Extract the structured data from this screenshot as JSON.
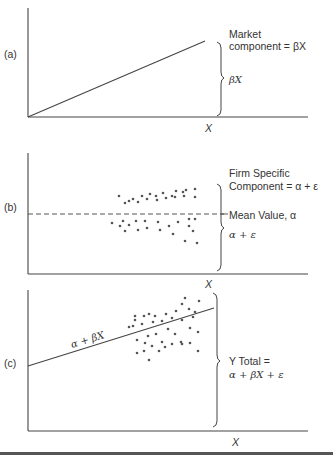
{
  "figure": {
    "panels": [
      {
        "id": "a",
        "tag": "(a)",
        "x_axis_label": "X",
        "labels": {
          "title_line1": "Market",
          "title_line2": "component = βX",
          "brace_label": "βX"
        },
        "line": {
          "label": "",
          "x1": 28,
          "y1": 117,
          "x2": 205,
          "y2": 41
        }
      },
      {
        "id": "b",
        "tag": "(b)",
        "x_axis_label": "X",
        "labels": {
          "title_line1": "Firm Specific",
          "title_line2": "Component = α + ε",
          "mean_label": "Mean Value, α",
          "brace_label": "α + ε"
        },
        "mean_line_y": 214
      },
      {
        "id": "c",
        "tag": "(c)",
        "x_axis_label": "X",
        "labels": {
          "line_label": "α + βX",
          "total_line1": "Y Total =",
          "total_line2": "α + βX + ε"
        },
        "line": {
          "x1": 28,
          "y1": 366,
          "x2": 214,
          "y2": 308
        }
      }
    ]
  },
  "chart_data": {
    "type": "scatter",
    "panels": [
      {
        "name": "(a) Market component",
        "series": [
          {
            "name": "βX",
            "kind": "line",
            "points": [
              [
                0,
                0
              ],
              [
                1,
                1
              ]
            ]
          }
        ],
        "annotations": [
          "Market component = βX",
          "βX"
        ],
        "xlabel": "X",
        "ylabel": ""
      },
      {
        "name": "(b) Firm specific component",
        "series": [
          {
            "name": "Mean Value, α",
            "kind": "dashed-horizontal-line",
            "y": 0
          },
          {
            "name": "α + ε",
            "kind": "scatter",
            "points_px": [
              [
                119,
                196
              ],
              [
                125,
                203
              ],
              [
                129,
                201
              ],
              [
                133,
                199
              ],
              [
                138,
                202
              ],
              [
                142,
                196
              ],
              [
                147,
                199
              ],
              [
                150,
                194
              ],
              [
                156,
                196
              ],
              [
                157,
                200
              ],
              [
                163,
                193
              ],
              [
                166,
                198
              ],
              [
                172,
                196
              ],
              [
                176,
                191
              ],
              [
                175,
                197
              ],
              [
                183,
                192
              ],
              [
                184,
                196
              ],
              [
                186,
                190
              ],
              [
                195,
                197
              ],
              [
                195,
                189
              ],
              [
                112,
                223
              ],
              [
                120,
                226
              ],
              [
                123,
                221
              ],
              [
                125,
                231
              ],
              [
                129,
                225
              ],
              [
                136,
                221
              ],
              [
                138,
                230
              ],
              [
                145,
                221
              ],
              [
                147,
                228
              ],
              [
                158,
                222
              ],
              [
                160,
                230
              ],
              [
                169,
                226
              ],
              [
                173,
                234
              ],
              [
                178,
                222
              ],
              [
                189,
                219
              ],
              [
                189,
                226
              ],
              [
                193,
                231
              ],
              [
                195,
                219
              ],
              [
                185,
                241
              ],
              [
                197,
                243
              ]
            ]
          }
        ],
        "annotations": [
          "Firm Specific Component = α + ε",
          "Mean Value, α",
          "α + ε"
        ],
        "xlabel": "X",
        "ylabel": ""
      },
      {
        "name": "(c) Y Total",
        "series": [
          {
            "name": "α + βX",
            "kind": "line",
            "points": [
              [
                0,
                0.25
              ],
              [
                1,
                0.55
              ]
            ]
          },
          {
            "name": "Y",
            "kind": "scatter",
            "points_px": [
              [
                135,
                316
              ],
              [
                149,
                314
              ],
              [
                155,
                316
              ],
              [
                166,
                314
              ],
              [
                176,
                311
              ],
              [
                182,
                304
              ],
              [
                185,
                298
              ],
              [
                189,
                309
              ],
              [
                195,
                312
              ],
              [
                199,
                301
              ],
              [
                129,
                327
              ],
              [
                135,
                320
              ],
              [
                144,
                316
              ],
              [
                153,
                322
              ],
              [
                162,
                321
              ],
              [
                172,
                318
              ],
              [
                182,
                320
              ],
              [
                193,
                317
              ],
              [
                133,
                326
              ],
              [
                142,
                324
              ],
              [
                137,
                340
              ],
              [
                148,
                336
              ],
              [
                156,
                334
              ],
              [
                162,
                342
              ],
              [
                168,
                329
              ],
              [
                175,
                334
              ],
              [
                182,
                344
              ],
              [
                190,
                328
              ],
              [
                198,
                332
              ],
              [
                137,
                353
              ],
              [
                144,
                351
              ],
              [
                152,
                346
              ],
              [
                159,
                351
              ],
              [
                165,
                347
              ],
              [
                172,
                344
              ],
              [
                181,
                342
              ],
              [
                190,
                343
              ],
              [
                198,
                351
              ],
              [
                149,
                360
              ],
              [
                145,
                343
              ]
            ]
          }
        ],
        "annotations": [
          "α + βX",
          "Y Total = α + βX + ε"
        ],
        "xlabel": "X",
        "ylabel": ""
      }
    ],
    "legend": "none",
    "grid": false
  }
}
